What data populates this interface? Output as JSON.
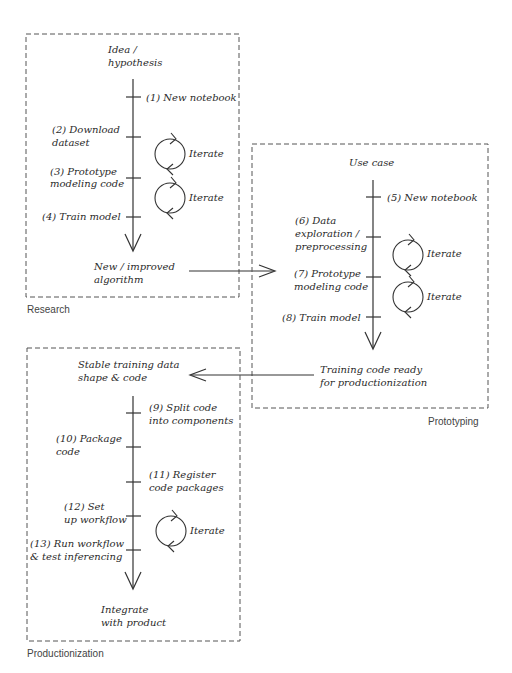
{
  "diagram": {
    "panels": {
      "research": {
        "caption": "Research",
        "start": [
          "Idea /",
          "hypothesis"
        ],
        "end": [
          "New / improved",
          "algorithm"
        ],
        "steps": [
          {
            "label": [
              "(1) New notebook"
            ],
            "side": "right"
          },
          {
            "label": [
              "(2) Download",
              "dataset"
            ],
            "side": "left"
          },
          {
            "label": [
              "(3) Prototype",
              "modeling code"
            ],
            "side": "left"
          },
          {
            "label": [
              "(4) Train model"
            ],
            "side": "left"
          }
        ],
        "iterate": [
          "Iterate",
          "Iterate"
        ]
      },
      "prototyping": {
        "caption": "Prototyping",
        "start": [
          "Use case"
        ],
        "end": [
          "Training code ready",
          "for productionization"
        ],
        "steps": [
          {
            "label": [
              "(5) New notebook"
            ],
            "side": "right"
          },
          {
            "label": [
              "(6) Data",
              "exploration /",
              "preprocessing"
            ],
            "side": "left"
          },
          {
            "label": [
              "(7) Prototype",
              "modeling code"
            ],
            "side": "left"
          },
          {
            "label": [
              "(8) Train model"
            ],
            "side": "left"
          }
        ],
        "iterate": [
          "Iterate",
          "Iterate"
        ]
      },
      "productionization": {
        "caption": "Productionization",
        "start": [
          "Stable training data",
          "shape & code"
        ],
        "end": [
          "Integrate",
          "with product"
        ],
        "steps": [
          {
            "label": [
              "(9) Split code",
              "into components"
            ],
            "side": "right"
          },
          {
            "label": [
              "(10) Package",
              "code"
            ],
            "side": "left"
          },
          {
            "label": [
              "(11) Register",
              "code packages"
            ],
            "side": "right"
          },
          {
            "label": [
              "(12) Set",
              "up workflow"
            ],
            "side": "left"
          },
          {
            "label": [
              "(13) Run workflow",
              "& test inferencing"
            ],
            "side": "left"
          }
        ],
        "iterate": [
          "Iterate"
        ]
      }
    },
    "connectors": [
      {
        "from": "research.end",
        "to": "prototyping",
        "direction": "right"
      },
      {
        "from": "prototyping.end",
        "to": "productionization.start",
        "direction": "left"
      }
    ],
    "colors": {
      "ink": "#2a2a2a",
      "frame": "#555555",
      "background": "#ffffff"
    }
  }
}
